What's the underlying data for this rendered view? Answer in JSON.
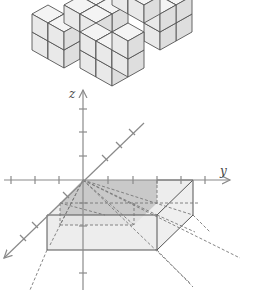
{
  "figure": {
    "axes": {
      "z_label": "z",
      "y_label": "y",
      "x_label": ""
    },
    "colors": {
      "axis": "#8a8a8a",
      "cube_face_top": "#f4f4f4",
      "cube_face_left": "#e9e9e9",
      "cube_face_right": "#dedede",
      "cube_edge": "#555555",
      "box_face_light": "#ececec",
      "box_face_shaded": "#c8c8c8",
      "dashed": "#777777"
    }
  },
  "caption": {
    "text": ""
  }
}
